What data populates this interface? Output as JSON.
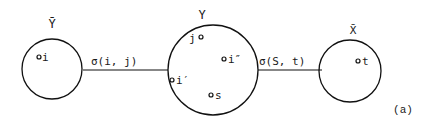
{
  "diagram": {
    "nodes": [
      {
        "id": "Ybar",
        "label": "Ȳ",
        "points": [
          {
            "label": "i"
          }
        ]
      },
      {
        "id": "Y",
        "label": "Y",
        "points": [
          {
            "label": "j"
          },
          {
            "label": "i″"
          },
          {
            "label": "i′"
          },
          {
            "label": "s"
          }
        ]
      },
      {
        "id": "Xbar",
        "label": "X̄",
        "points": [
          {
            "label": "t"
          }
        ]
      }
    ],
    "edges": [
      {
        "from": "Ybar",
        "to": "Y",
        "label": "σ(i, j)"
      },
      {
        "from": "Y",
        "to": "Xbar",
        "label": "σ(S, t)"
      }
    ],
    "caption": "(a)"
  }
}
